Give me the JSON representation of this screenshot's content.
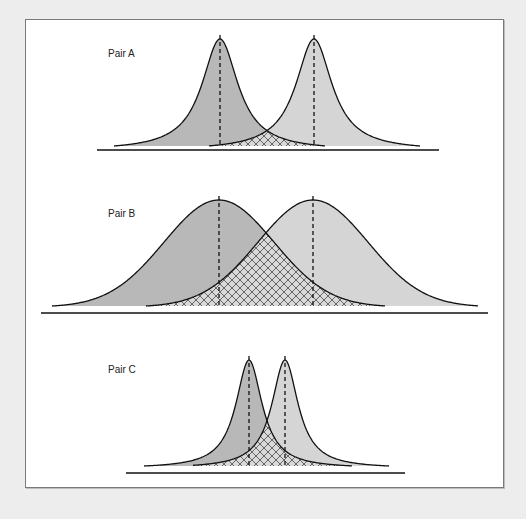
{
  "figure": {
    "background": "#ededed",
    "frame_fill": "#ffffff",
    "colors": {
      "left_curve_fill": "#b8b8b8",
      "right_curve_fill": "#d5d5d5",
      "overlap_fill": "#d9d9d9",
      "hatch": "#4a4a4a",
      "stroke": "#111111"
    }
  },
  "chart_data": {
    "type": "diagram",
    "title": "",
    "pairs": [
      {
        "label": "Pair A",
        "label_pos": [
          108,
          58
        ],
        "shape": "peaked",
        "baseline": {
          "y": 150,
          "x1": 97,
          "x2": 439
        },
        "curve_bottom_y": 146,
        "peak_y": 39,
        "width": 22,
        "curves": [
          {
            "name": "left",
            "mean_x": 220,
            "x_start": 114,
            "x_end": 325
          },
          {
            "name": "right",
            "mean_x": 314,
            "x_start": 209,
            "x_end": 420
          }
        ]
      },
      {
        "label": "Pair B",
        "label_pos": [
          108,
          218
        ],
        "shape": "normal",
        "baseline": {
          "y": 313,
          "x1": 41,
          "x2": 488
        },
        "curve_bottom_y": 306,
        "peak_y": 200,
        "width": 55,
        "curves": [
          {
            "name": "left",
            "mean_x": 219,
            "x_start": 52,
            "x_end": 385
          },
          {
            "name": "right",
            "mean_x": 313,
            "x_start": 146,
            "x_end": 478
          }
        ]
      },
      {
        "label": "Pair C",
        "label_pos": [
          108,
          374
        ],
        "shape": "peaked",
        "baseline": {
          "y": 473,
          "x1": 126,
          "x2": 405
        },
        "curve_bottom_y": 466,
        "peak_y": 360,
        "width": 16,
        "curves": [
          {
            "name": "left",
            "mean_x": 249,
            "x_start": 144,
            "x_end": 352
          },
          {
            "name": "right",
            "mean_x": 285,
            "x_start": 193,
            "x_end": 389
          }
        ]
      }
    ]
  }
}
